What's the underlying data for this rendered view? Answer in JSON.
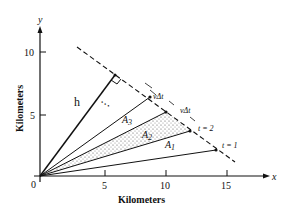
{
  "diagram": {
    "axes": {
      "x_label": "x",
      "y_label": "y",
      "x_title": "Kilometers",
      "y_title": "Kilometers",
      "origin_label": "0",
      "x_ticks": [
        "5",
        "10",
        "15"
      ],
      "y_ticks": [
        "5",
        "10"
      ]
    },
    "labels": {
      "h": "h",
      "A1": "A",
      "A1_sub": "1",
      "A2": "A",
      "A2_sub": "2",
      "A3": "A",
      "A3_sub": "3",
      "vdt_1": "vΔt",
      "vdt_2": "vΔt",
      "t1": "t = 1",
      "t2": "t = 2",
      "ellipsis": "• • •"
    },
    "colors": {
      "ink": "#111111",
      "shade": "#9a9a9a",
      "background": "#ffffff"
    }
  }
}
